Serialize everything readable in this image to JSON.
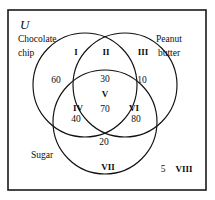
{
  "figure": {
    "type": "venn-diagram-3-set",
    "universe_symbol": "U",
    "stroke_color": "#111111",
    "frame_color": "#1a1a1a",
    "background_color": "#ffffff"
  },
  "sets": [
    {
      "id": "chocolate-chip",
      "label_line1": "Chocolate",
      "label_line2": "chip"
    },
    {
      "id": "peanut-butter",
      "label_line1": "Peanut",
      "label_line2": "butter"
    },
    {
      "id": "sugar",
      "label_line1": "Sugar",
      "label_line2": ""
    }
  ],
  "regions": [
    {
      "id": "region-1",
      "numeral": "I",
      "count": "60"
    },
    {
      "id": "region-2",
      "numeral": "II",
      "count": "30"
    },
    {
      "id": "region-3",
      "numeral": "III",
      "count": "10"
    },
    {
      "id": "region-4",
      "numeral": "IV",
      "count": "40"
    },
    {
      "id": "region-5",
      "numeral": "V",
      "count": "70"
    },
    {
      "id": "region-6",
      "numeral": "VI",
      "count": "80"
    },
    {
      "id": "region-7",
      "numeral": "VII",
      "count": "20"
    },
    {
      "id": "region-8",
      "numeral": "VIII",
      "count": "5"
    }
  ]
}
